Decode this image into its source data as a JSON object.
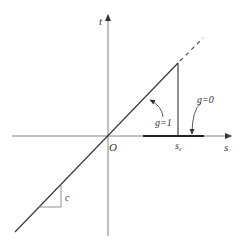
{
  "diagram": {
    "type": "piecewise-linear-function-sketch",
    "axes": {
      "horizontal_label": "s",
      "vertical_label": "t",
      "origin_label": "O"
    },
    "annotations": {
      "s_c_label": "s",
      "s_c_subscript": "c",
      "g1_label": "g=1",
      "g0_label": "g=0",
      "slope_label": "c"
    },
    "colors": {
      "line": "#333333",
      "axis": "#555555",
      "background": "#ffffff"
    }
  }
}
